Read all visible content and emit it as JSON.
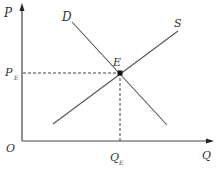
{
  "diagram": {
    "type": "supply-demand",
    "axes": {
      "y_label": "P",
      "x_label": "Q",
      "origin_label": "O"
    },
    "curves": {
      "demand_label": "D",
      "supply_label": "S"
    },
    "equilibrium": {
      "point_label": "E",
      "price_label_main": "P",
      "price_label_sub": "E",
      "quantity_label_main": "Q",
      "quantity_label_sub": "E"
    },
    "colors": {
      "line": "#444444",
      "text": "#333333"
    }
  }
}
